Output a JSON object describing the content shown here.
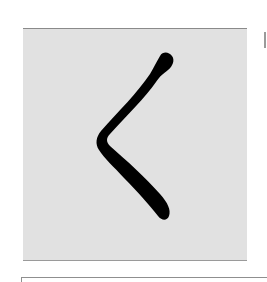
{
  "figure": {
    "character": "く",
    "character_reading": "ku",
    "panel_color": "#e1e1e1",
    "stroke_color": "#000000",
    "background_color": "#ffffff"
  }
}
